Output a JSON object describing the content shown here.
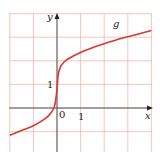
{
  "chart_data": {
    "type": "line",
    "title": "",
    "xlabel": "x",
    "ylabel": "y",
    "xlim": [
      -2,
      4
    ],
    "ylim": [
      -2,
      4
    ],
    "grid": true,
    "tick_labels": {
      "origin": "0",
      "x_one": "1",
      "y_one": "1"
    },
    "series": [
      {
        "name": "g",
        "color": "#d9382f",
        "x": [
          -2,
          -1.5,
          -1,
          -0.5,
          -0.25,
          -0.1,
          0,
          0.05,
          0.15,
          0.3,
          0.5,
          1,
          1.5,
          2,
          2.5,
          3,
          3.5,
          4
        ],
        "y": [
          -1.15,
          -0.95,
          -0.75,
          -0.45,
          -0.2,
          0.1,
          0.8,
          1.4,
          1.75,
          1.95,
          2.1,
          2.35,
          2.55,
          2.72,
          2.88,
          3.02,
          3.15,
          3.28
        ]
      }
    ]
  },
  "colors": {
    "grid": "#f2b8b0",
    "axis": "#555555",
    "curve": "#d9382f"
  },
  "labels": {
    "x_axis": "x",
    "y_axis": "y",
    "curve_name": "g",
    "origin": "0",
    "x_tick": "1",
    "y_tick": "1"
  }
}
